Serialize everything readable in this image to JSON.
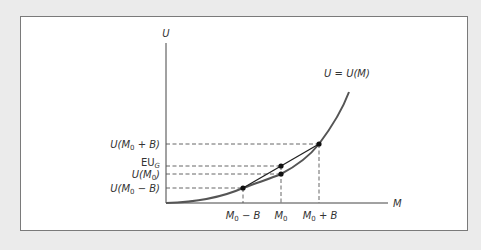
{
  "diagram": {
    "axes": {
      "y_label": "U",
      "x_label": "M"
    },
    "curve_label": "U = U(M)",
    "y_ticks": [
      {
        "id": "u_m0_plus_b",
        "label": "U(M0 + B)",
        "base": "U(M",
        "sub": "0",
        "tail": " + B)"
      },
      {
        "id": "eu_g",
        "label": "EU_G",
        "base": "EU",
        "sub": "G",
        "tail": ""
      },
      {
        "id": "u_m0",
        "label": "U(M0)",
        "base": "U(M",
        "sub": "0",
        "tail": ")"
      },
      {
        "id": "u_m0_minus_b",
        "label": "U(M0 − B)",
        "base": "U(M",
        "sub": "0",
        "tail": " − B)"
      }
    ],
    "x_ticks": [
      {
        "id": "m0_minus_b",
        "label": "M0 − B",
        "base": "M",
        "sub": "0",
        "tail": " − B"
      },
      {
        "id": "m0",
        "label": "M0",
        "base": "M",
        "sub": "0",
        "tail": ""
      },
      {
        "id": "m0_plus_b",
        "label": "M0 + B",
        "base": "M",
        "sub": "0",
        "tail": " + B"
      }
    ],
    "colors": {
      "background": "#ebebeb",
      "panel": "#ffffff",
      "curve": "#555555",
      "chord": "#222222",
      "dashes": "#555555"
    }
  }
}
